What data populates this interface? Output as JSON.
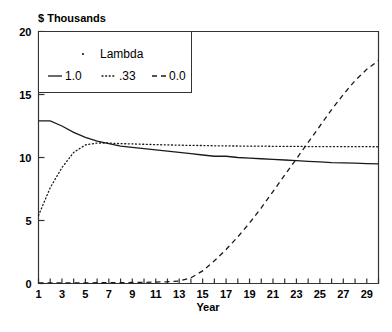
{
  "chart_data": {
    "type": "line",
    "title": "",
    "ylabel": "$ Thousands",
    "xlabel": "Year",
    "ylim": [
      0,
      20
    ],
    "xlim": [
      1,
      30
    ],
    "grid": false,
    "legend_position": "top-left",
    "legend_title": "Lambda",
    "y_ticks": [
      "0",
      "5",
      "10",
      "15",
      "20"
    ],
    "y_tick_values": [
      0,
      5,
      10,
      15,
      20
    ],
    "x_ticks": [
      "1",
      "3",
      "5",
      "7",
      "9",
      "11",
      "13",
      "15",
      "17",
      "19",
      "21",
      "23",
      "25",
      "27",
      "29"
    ],
    "x_tick_values": [
      1,
      3,
      5,
      7,
      9,
      11,
      13,
      15,
      17,
      19,
      21,
      23,
      25,
      27,
      29
    ],
    "x": [
      1,
      2,
      3,
      4,
      5,
      6,
      7,
      8,
      9,
      10,
      11,
      12,
      13,
      14,
      15,
      16,
      17,
      18,
      19,
      20,
      21,
      22,
      23,
      24,
      25,
      26,
      27,
      28,
      29,
      30
    ],
    "series": [
      {
        "name": "1.0",
        "style": "solid",
        "color": "#1a1a1a",
        "values": [
          12.9,
          12.9,
          12.5,
          12.0,
          11.6,
          11.3,
          11.1,
          10.9,
          10.8,
          10.7,
          10.6,
          10.5,
          10.4,
          10.3,
          10.2,
          10.1,
          10.1,
          10.0,
          9.95,
          9.9,
          9.85,
          9.8,
          9.75,
          9.7,
          9.65,
          9.6,
          9.58,
          9.55,
          9.52,
          9.5
        ]
      },
      {
        "name": ".33",
        "style": "dotted",
        "color": "#1a1a1a",
        "values": [
          5.4,
          7.6,
          9.2,
          10.4,
          11.0,
          11.15,
          11.15,
          11.1,
          11.08,
          11.05,
          11.02,
          11.0,
          10.98,
          10.96,
          10.95,
          10.93,
          10.92,
          10.91,
          10.9,
          10.9,
          10.89,
          10.88,
          10.88,
          10.87,
          10.87,
          10.87,
          10.86,
          10.86,
          10.86,
          10.85
        ]
      },
      {
        "name": "0.0",
        "style": "dashed",
        "color": "#1a1a1a",
        "values": [
          0.05,
          0.05,
          0.05,
          0.05,
          0.05,
          0.06,
          0.06,
          0.07,
          0.08,
          0.09,
          0.11,
          0.14,
          0.2,
          0.45,
          1.0,
          1.8,
          2.7,
          3.7,
          4.8,
          6.0,
          7.3,
          8.6,
          9.9,
          11.2,
          12.5,
          13.8,
          15.0,
          16.1,
          17.0,
          17.7
        ]
      }
    ]
  }
}
